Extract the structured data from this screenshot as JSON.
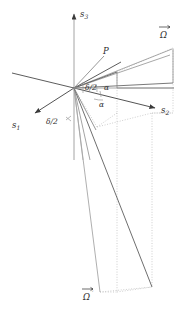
{
  "figure": {
    "background": "#ffffff",
    "width": 191,
    "height": 310,
    "colors": {
      "axis": "#3a3a3a",
      "ray_dark": "#4a4a4a",
      "ray_mid": "#8a8a8a",
      "ray_light": "#b5b5b5",
      "dotted": "#bdbdbd",
      "label": "#2b2b2b",
      "arc": "#9a9a9a"
    }
  },
  "axes": [
    {
      "id": "s1",
      "label": "s",
      "subscript": "1",
      "tip_x": 33,
      "tip_y": 114,
      "label_x": 12,
      "label_y": 127
    },
    {
      "id": "s2",
      "label": "s",
      "subscript": "2",
      "tip_x": 157,
      "tip_y": 108,
      "label_x": 163,
      "label_y": 113
    },
    {
      "id": "s3",
      "label": "s",
      "subscript": "3",
      "tip_x": 74,
      "tip_y": 12,
      "label_x": 80,
      "label_y": 16
    }
  ],
  "vectors": [
    {
      "id": "P",
      "label": "P",
      "label_x": 101,
      "label_y": 53
    },
    {
      "id": "Omega",
      "label": "Ω",
      "accent": "arrow",
      "label_x": 163,
      "label_y": 34
    },
    {
      "id": "Omega_prime",
      "label": "Ω",
      "accent": "arrow",
      "prime": "′",
      "label_x": 86,
      "label_y": 297
    }
  ],
  "angles": [
    {
      "id": "delta-over-2-upper",
      "label": "δ/2",
      "label_x": 84,
      "label_y": 87
    },
    {
      "id": "alpha-upper",
      "label": "α",
      "label_x": 105,
      "label_y": 89
    },
    {
      "id": "alpha-lower",
      "label": "α",
      "label_x": 100,
      "label_y": 105
    },
    {
      "id": "delta-over-2-left",
      "label": "δ/2",
      "label_x": 48,
      "label_y": 124
    }
  ],
  "origin": {
    "x": 74,
    "y": 88
  }
}
